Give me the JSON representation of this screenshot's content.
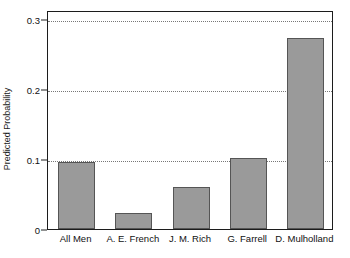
{
  "chart_data": {
    "type": "bar",
    "title": "",
    "xlabel": "",
    "ylabel": "Predicted Probability",
    "categories": [
      "All Men",
      "A. E. French",
      "J. M. Rich",
      "G. Farrell",
      "D. Mulholland"
    ],
    "values": [
      0.095,
      0.023,
      0.06,
      0.102,
      0.272
    ],
    "ylim": [
      0,
      0.3125
    ],
    "yticks": [
      0,
      0.1,
      0.2,
      0.3
    ],
    "ytick_labels": [
      "0",
      "0.1",
      "0.2",
      "0.3"
    ],
    "grid": "horizontal-dotted",
    "legend": "none",
    "bar_color": "#9a9a9a",
    "bar_edge_color": "#555555",
    "axis_color": "#1c1c1c",
    "grid_color": "#777777",
    "background": "#ffffff"
  }
}
